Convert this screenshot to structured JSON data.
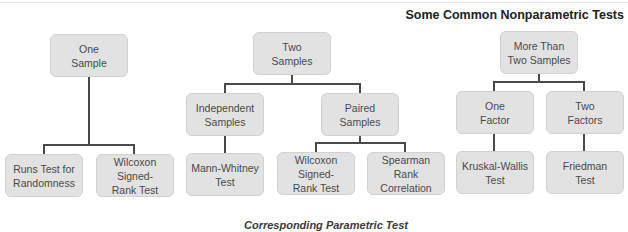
{
  "title": "Some Common Nonparametric Tests",
  "footer": "Corresponding Parametric Test",
  "colors": {
    "box_fill": "#e2e2e2",
    "box_border": "#d2d2d2",
    "connector": "#4a4a4a",
    "text": "#4a4a4a"
  },
  "tree": {
    "one_sample": {
      "label": "One\nSample",
      "children": [
        {
          "label": "Runs Test for\nRandomness"
        },
        {
          "label": "Wilcoxon\nSigned-\nRank Test"
        }
      ]
    },
    "two_samples": {
      "label": "Two\nSamples",
      "independent": {
        "label": "Independent\nSamples",
        "children": [
          {
            "label": "Mann-Whitney\nTest"
          }
        ]
      },
      "paired": {
        "label": "Paired\nSamples",
        "children": [
          {
            "label": "Wilcoxon\nSigned-\nRank Test"
          },
          {
            "label": "Spearman\nRank\nCorrelation"
          }
        ]
      }
    },
    "more_than_two": {
      "label": "More Than\nTwo Samples",
      "one_factor": {
        "label": "One\nFactor",
        "children": [
          {
            "label": "Kruskal-Wallis\nTest"
          }
        ]
      },
      "two_factors": {
        "label": "Two\nFactors",
        "children": [
          {
            "label": "Friedman\nTest"
          }
        ]
      }
    }
  }
}
